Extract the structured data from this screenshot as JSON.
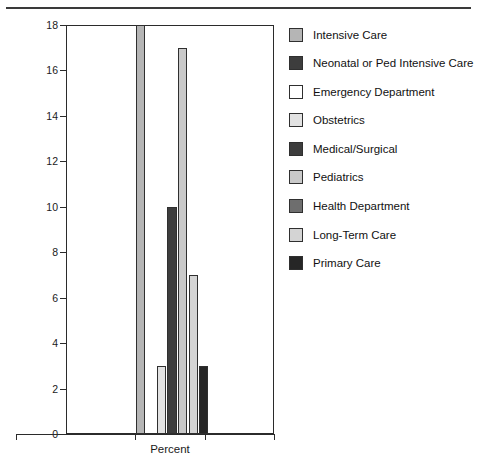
{
  "chart_data": {
    "type": "bar",
    "title": "",
    "xlabel": "Percent",
    "ylabel": "",
    "ylim": [
      0,
      18
    ],
    "ytick_labels": [
      "0",
      "2",
      "4",
      "6",
      "8",
      "10",
      "12",
      "14",
      "16",
      "18"
    ],
    "ytick_values": [
      0,
      2,
      4,
      6,
      8,
      10,
      12,
      14,
      16,
      18
    ],
    "grid": false,
    "legend_position": "right",
    "categories": [
      "Intensive Care",
      "Neonatal or Ped Intensive Care",
      "Emergency Department",
      "Obstetrics",
      "Medical/Surgical",
      "Pediatrics",
      "Health Department",
      "Long-Term Care",
      "Primary Care"
    ],
    "values": [
      18,
      0,
      0,
      3,
      10,
      17,
      0,
      7,
      3
    ],
    "series": [
      {
        "name": "Percent",
        "points": [
          {
            "label": "Intensive Care",
            "value": 18,
            "color": "#b5b5b5"
          },
          {
            "label": "Neonatal or Ped Intensive Care",
            "value": 0,
            "color": "#3d3d3d"
          },
          {
            "label": "Emergency Department",
            "value": 0,
            "color": "#ffffff"
          },
          {
            "label": "Obstetrics",
            "value": 3,
            "color": "#e2e2e2"
          },
          {
            "label": "Medical/Surgical",
            "value": 10,
            "color": "#3d3d3d"
          },
          {
            "label": "Pediatrics",
            "value": 17,
            "color": "#c9c9c9"
          },
          {
            "label": "Health Department",
            "value": 0,
            "color": "#6e6e6e"
          },
          {
            "label": "Long-Term Care",
            "value": 7,
            "color": "#d4d4d4"
          },
          {
            "label": "Primary Care",
            "value": 3,
            "color": "#262626"
          }
        ]
      }
    ]
  },
  "legend": {
    "items": [
      {
        "label": "Intensive Care",
        "color": "#b5b5b5"
      },
      {
        "label": "Neonatal or Ped Intensive Care",
        "color": "#3d3d3d"
      },
      {
        "label": "Emergency Department",
        "color": "#ffffff"
      },
      {
        "label": "Obstetrics",
        "color": "#e2e2e2"
      },
      {
        "label": "Medical/Surgical",
        "color": "#3d3d3d"
      },
      {
        "label": "Pediatrics",
        "color": "#c9c9c9"
      },
      {
        "label": "Health Department",
        "color": "#6e6e6e"
      },
      {
        "label": "Long-Term Care",
        "color": "#d4d4d4"
      },
      {
        "label": "Primary Care",
        "color": "#262626"
      }
    ]
  },
  "axes": {
    "x_axis_label": "Percent",
    "y_axis_label": ""
  }
}
